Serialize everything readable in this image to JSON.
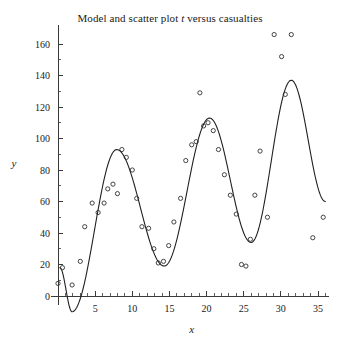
{
  "chart_data": {
    "type": "scatter",
    "title": "Model and scatter plot t versus casualties",
    "title_parts": {
      "before": "Model and scatter plot ",
      "italic": "t",
      "after": " versus casualties"
    },
    "xlabel": "x",
    "ylabel": "y",
    "grid": false,
    "legend": null,
    "xlim": [
      -1,
      36.5
    ],
    "ylim": [
      -12,
      172
    ],
    "x_ticks_major": [
      5,
      10,
      15,
      20,
      25,
      30,
      35
    ],
    "x_tick_labels": [
      "5",
      "10",
      "15",
      "20",
      "25",
      "30",
      "35"
    ],
    "x_ticks_minor_step": 1,
    "y_ticks_major": [
      0,
      20,
      40,
      60,
      80,
      100,
      120,
      140,
      160
    ],
    "y_tick_labels": [
      "0",
      "20",
      "40",
      "60",
      "80",
      "100",
      "120",
      "140",
      "160"
    ],
    "y_ticks_minor_step": 10,
    "series": [
      {
        "name": "scatter",
        "marker": "open-circle",
        "x": [
          0.0,
          0.6,
          1.9,
          3.0,
          3.6,
          4.6,
          5.4,
          6.2,
          6.7,
          7.4,
          8.0,
          8.6,
          9.2,
          10.0,
          10.6,
          11.3,
          12.2,
          12.9,
          13.5,
          14.2,
          14.9,
          15.6,
          16.5,
          17.2,
          18.0,
          18.6,
          19.1,
          19.6,
          20.2,
          20.9,
          21.6,
          22.4,
          23.2,
          24.0,
          24.7,
          25.3,
          25.9,
          26.5,
          27.2,
          28.2,
          29.1,
          30.1,
          30.6,
          31.4,
          34.3,
          35.7
        ],
        "y": [
          8,
          18,
          7,
          22,
          44,
          59,
          53,
          59,
          68,
          71,
          65,
          93,
          88,
          80,
          62,
          44,
          43,
          30,
          21,
          22,
          32,
          47,
          62,
          86,
          96,
          98,
          129,
          108,
          110,
          105,
          93,
          77,
          64,
          52,
          20,
          19,
          36,
          64,
          92,
          50,
          166,
          152,
          128,
          166,
          37,
          50
        ]
      },
      {
        "name": "model",
        "marker": "line",
        "description": "fitted oscillating model curve with growing amplitude",
        "peaks": [
          {
            "x": 7.9,
            "y": 93
          },
          {
            "x": 20.4,
            "y": 113
          },
          {
            "x": 31.4,
            "y": 137
          }
        ],
        "troughs": [
          {
            "x": 1.9,
            "y": -10
          },
          {
            "x": 14.3,
            "y": 19
          },
          {
            "x": 26.0,
            "y": 34
          }
        ],
        "x_start": 0.25,
        "x_end": 36.0,
        "y_start": 18,
        "y_end": 60
      }
    ],
    "point_count": 46
  }
}
